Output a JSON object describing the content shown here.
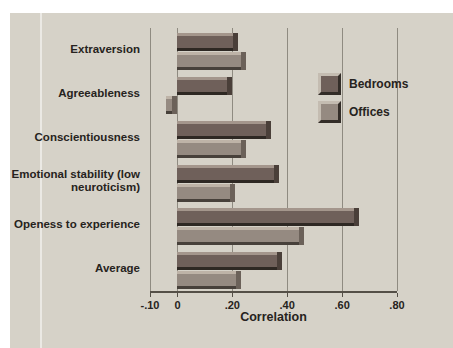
{
  "figure": {
    "page_bg": "#ffffff",
    "panel_bg": "#d6d2c8",
    "grid_color": "#8f8b81",
    "axis_color": "#544f47",
    "text_color": "#262320"
  },
  "chart_data": {
    "type": "bar",
    "orientation": "horizontal",
    "title": "",
    "xlabel": "Correlation",
    "categories": [
      "Extraversion",
      "Agreeableness",
      "Conscientiousness",
      "Emotional stability (low neuroticism)",
      "Openess to experience",
      "Average"
    ],
    "series": [
      {
        "name": "Bedrooms",
        "color": "#6f605a",
        "highlight": "#a4968c",
        "shadow": "#2e2823",
        "cap": "#4a3f39",
        "values": [
          0.22,
          0.2,
          0.34,
          0.37,
          0.66,
          0.38
        ]
      },
      {
        "name": "Offices",
        "color": "#958a81",
        "highlight": "#beb3a7",
        "shadow": "#47403a",
        "cap": "#6b6159",
        "values": [
          0.25,
          -0.04,
          0.25,
          0.21,
          0.46,
          0.23
        ]
      }
    ],
    "xlim": [
      -0.1,
      0.8
    ],
    "xticks": [
      -0.1,
      0,
      0.2,
      0.4,
      0.6,
      0.8
    ],
    "xtick_labels": [
      "-.10",
      "0",
      ".20",
      ".40",
      ".60",
      ".80"
    ],
    "grid": true,
    "legend_position": "upper-right"
  }
}
